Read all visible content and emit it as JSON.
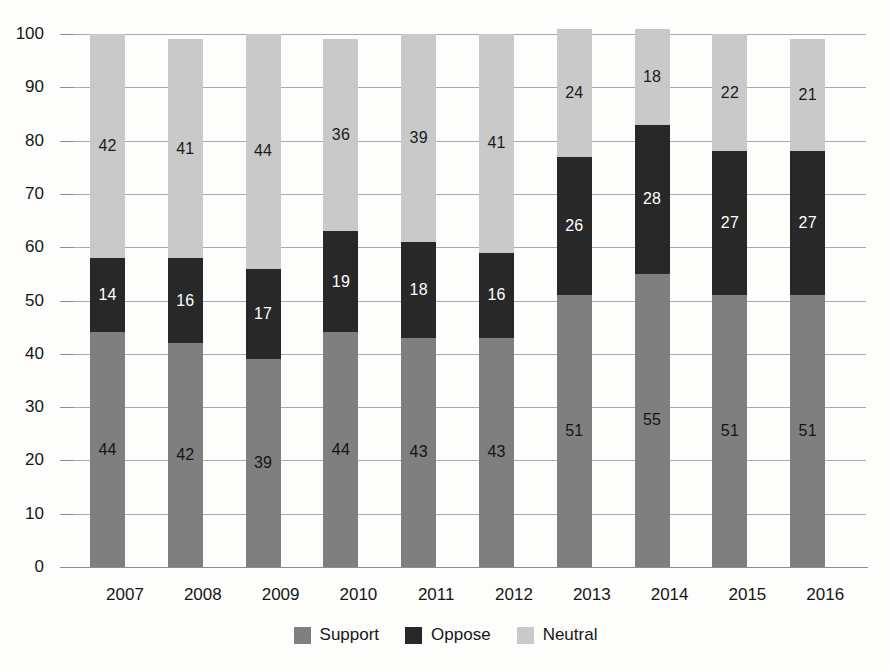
{
  "chart_data": {
    "type": "bar",
    "subtype": "stacked-bar",
    "title": "",
    "subtitle": "",
    "xlabel": "",
    "ylabel": "",
    "ylim": [
      0,
      100
    ],
    "yticks": [
      0,
      10,
      20,
      30,
      40,
      50,
      60,
      70,
      80,
      90,
      100
    ],
    "grid": true,
    "legend_position": "bottom-center",
    "stack_order_bottom_to_top": [
      "Support",
      "Oppose",
      "Neutral"
    ],
    "categories": [
      "2007",
      "2008",
      "2009",
      "2010",
      "2011",
      "2012",
      "2013",
      "2014",
      "2015",
      "2016"
    ],
    "series": [
      {
        "name": "Support",
        "color": "#7f7f7f",
        "values": [
          44,
          42,
          39,
          44,
          43,
          43,
          51,
          55,
          51,
          51
        ]
      },
      {
        "name": "Oppose",
        "color": "#282828",
        "values": [
          14,
          16,
          17,
          19,
          18,
          16,
          26,
          28,
          27,
          27
        ]
      },
      {
        "name": "Neutral",
        "color": "#c9c9c9",
        "values": [
          42,
          41,
          44,
          36,
          39,
          41,
          24,
          18,
          22,
          21
        ]
      }
    ],
    "data_labels_shown": true
  },
  "axis": {
    "y_tick_labels": [
      "100",
      "90",
      "80",
      "70",
      "60",
      "50",
      "40",
      "30",
      "20",
      "10",
      "0"
    ],
    "x_tick_labels": [
      "2007",
      "2008",
      "2009",
      "2010",
      "2011",
      "2012",
      "2013",
      "2014",
      "2015",
      "2016"
    ]
  },
  "legend": {
    "items": [
      {
        "label": "Support",
        "color": "#7f7f7f"
      },
      {
        "label": "Oppose",
        "color": "#282828"
      },
      {
        "label": "Neutral",
        "color": "#c9c9c9"
      }
    ]
  },
  "colors": {
    "support": "#7f7f7f",
    "oppose": "#282828",
    "neutral": "#c9c9c9",
    "gridline": "#a9a9a9",
    "axis": "#8d8d8d",
    "background": "#fdfdfc",
    "text": "#161616"
  }
}
